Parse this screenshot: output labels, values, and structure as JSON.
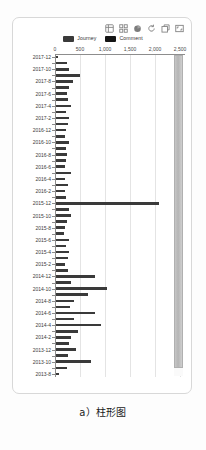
{
  "panel": {
    "toolbox": [
      {
        "name": "data-view-icon",
        "title": "Data view"
      },
      {
        "name": "grid-icon",
        "title": "Grid"
      },
      {
        "name": "pie-chart-icon",
        "title": "Pie chart"
      },
      {
        "name": "refresh-icon",
        "title": "Refresh"
      },
      {
        "name": "restore-icon",
        "title": "Restore"
      },
      {
        "name": "fullscreen-icon",
        "title": "Fullscreen"
      }
    ],
    "legend": [
      {
        "label": "Journey",
        "color": "#3a3a3a"
      },
      {
        "label": "Comment",
        "color": "#151515"
      }
    ]
  },
  "caption": "a）柱形图",
  "chart_data": {
    "type": "bar",
    "orientation": "horizontal",
    "title": "",
    "xlabel": "",
    "ylabel": "",
    "xlim": [
      0,
      2600
    ],
    "xticks": [
      0,
      500,
      1000,
      1500,
      2000,
      2500
    ],
    "xticklabels": [
      "0",
      "500",
      "1,000",
      "1,500",
      "2,000",
      "2,500"
    ],
    "grid": true,
    "legend_position": "top-center",
    "series_name": "Journey",
    "bar_color": "#3a3a3a",
    "categories": [
      "2017-12",
      "2017-11",
      "2017-10",
      "2017-9",
      "2017-8",
      "2017-7",
      "2017-6",
      "2017-5",
      "2017-4",
      "2017-3",
      "2017-2",
      "2017-1",
      "2016-12",
      "2016-11",
      "2016-10",
      "2016-9",
      "2016-8",
      "2016-7",
      "2016-6",
      "2016-5",
      "2016-4",
      "2016-3",
      "2016-2",
      "2016-1",
      "2015-12",
      "2015-11",
      "2015-10",
      "2015-9",
      "2015-8",
      "2015-7",
      "2015-6",
      "2015-5",
      "2015-4",
      "2015-3",
      "2015-2",
      "2015-1",
      "2014-12",
      "2014-11",
      "2014-10",
      "2014-9",
      "2014-8",
      "2014-7",
      "2014-6",
      "2014-5",
      "2014-4",
      "2014-3",
      "2014-2",
      "2014-1",
      "2013-12",
      "2013-11",
      "2013-10",
      "2013-9",
      "2013-8"
    ],
    "labeled_categories": [
      "2017-12",
      "2017-10",
      "2017-8",
      "2017-6",
      "2017-4",
      "2017-2",
      "2016-12",
      "2016-10",
      "2016-8",
      "2016-6",
      "2016-4",
      "2016-2",
      "2015-12",
      "2015-10",
      "2015-8",
      "2015-6",
      "2015-4",
      "2015-2",
      "2014-12",
      "2014-10",
      "2014-8",
      "2014-6",
      "2014-4",
      "2014-2",
      "2013-12",
      "2013-10",
      "2013-8"
    ],
    "values": [
      30,
      215,
      250,
      470,
      330,
      255,
      225,
      245,
      290,
      205,
      255,
      230,
      200,
      170,
      250,
      195,
      215,
      200,
      180,
      300,
      180,
      235,
      180,
      205,
      2060,
      250,
      290,
      215,
      180,
      165,
      250,
      200,
      255,
      235,
      180,
      230,
      780,
      290,
      1020,
      640,
      365,
      280,
      770,
      350,
      890,
      430,
      300,
      255,
      390,
      235,
      700,
      215,
      55
    ]
  }
}
